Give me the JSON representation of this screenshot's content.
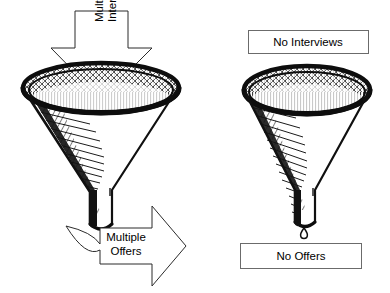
{
  "figure": {
    "background_color": "#ffffff",
    "ink_color": "#000000",
    "outline_color": "#2b2b2b",
    "box_border_color": "#6b6b6b"
  },
  "left_panel": {
    "name": "successful-funnel",
    "inflow_arrow": {
      "icon": "down-arrow-icon",
      "direction": "down",
      "line1": "Multiple",
      "line2": "Interviews",
      "text_rotation_deg": -90
    },
    "funnel": {
      "icon": "funnel-icon",
      "style": "hand-drawn-hatched"
    },
    "outflow_arrow": {
      "icon": "curved-right-arrow-icon",
      "direction": "right",
      "line1": "Multiple",
      "line2": "Offers"
    }
  },
  "right_panel": {
    "name": "unsuccessful-funnel",
    "top_box": {
      "icon": "label-box-icon",
      "label": "No Interviews"
    },
    "funnel": {
      "icon": "funnel-icon",
      "style": "hand-drawn-hatched"
    },
    "drip": {
      "icon": "droplet-icon",
      "count": 1
    },
    "bottom_box": {
      "icon": "label-box-icon",
      "label": "No Offers"
    }
  }
}
